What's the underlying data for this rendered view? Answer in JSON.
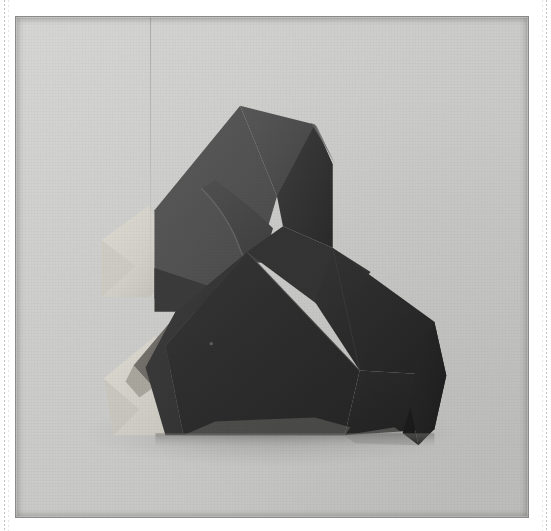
{
  "page": {
    "width": 551,
    "height": 531,
    "background_color": "#ffffff",
    "header_fragments": [
      "",
      "",
      "",
      ""
    ]
  },
  "photo": {
    "alt_text": "Black and white photograph of a folded origami model",
    "caption": "",
    "frame": {
      "x": 15,
      "y": 16,
      "width": 514,
      "height": 502
    },
    "border_color": "#8a8a8a",
    "background_color": "#c9c9c7",
    "subject": "origami-figure",
    "palette": {
      "backdrop_light": "#d2d2d0",
      "backdrop_mid": "#c4c4c2",
      "backdrop_shadow": "#a8a8a6",
      "paper_white": "#d9d6ce",
      "paper_white_shade": "#bcb9b1",
      "facet_darkest": "#232323",
      "facet_dark": "#2d2d2d",
      "facet_mid_dark": "#3a3a3a",
      "facet_mid": "#474747",
      "facet_light": "#545454",
      "facet_lightest": "#5e5e5e",
      "edge_highlight": "#6d6d6d",
      "cast_shadow": "#9b9b99"
    }
  }
}
